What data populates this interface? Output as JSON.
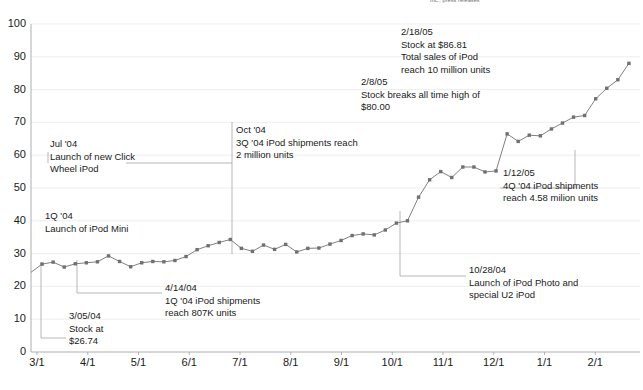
{
  "source_note": "Inc., press releases",
  "chart_data": {
    "type": "line",
    "title": "",
    "subtitle": "",
    "xlabel": "",
    "ylabel": "",
    "ylim": [
      0,
      100
    ],
    "yticks": [
      0,
      10,
      20,
      30,
      40,
      50,
      60,
      70,
      80,
      90,
      100
    ],
    "xticks": [
      "3/1",
      "4/1",
      "5/1",
      "6/1",
      "7/1",
      "8/1",
      "9/1",
      "10/1",
      "11/1",
      "12/1",
      "1/1",
      "2/1"
    ],
    "grid": true,
    "legend": "none",
    "series": [
      {
        "name": "Apple stock price",
        "color": "#808080",
        "marker": "square",
        "values": [
          24.3,
          26.8,
          27.4,
          25.9,
          26.9,
          27.2,
          27.5,
          29.3,
          27.6,
          26.0,
          27.2,
          27.6,
          27.5,
          27.9,
          29.1,
          31.2,
          32.4,
          33.4,
          34.3,
          31.6,
          30.7,
          32.6,
          31.3,
          32.8,
          30.5,
          31.6,
          31.7,
          32.9,
          34.0,
          35.5,
          36.0,
          35.7,
          37.2,
          39.3,
          40.0,
          47.2,
          52.5,
          55.0,
          53.2,
          56.4,
          56.4,
          54.9,
          55.2,
          66.5,
          64.2,
          66.1,
          65.9,
          68.0,
          69.8,
          71.6,
          72.1,
          77.2,
          80.4,
          83.0,
          88.0
        ]
      }
    ],
    "annotations": [
      {
        "id": "1q04-ipod-mini",
        "lines": [
          "1Q '04",
          "Launch of iPod Mini"
        ],
        "x": 45,
        "y": 210
      },
      {
        "id": "jul04-click-wheel",
        "lines": [
          "Jul '04",
          "Launch of new Click",
          "Wheel iPod"
        ],
        "x": 50,
        "y": 138
      },
      {
        "id": "oct04-3q-shipments",
        "lines": [
          "Oct '04",
          "3Q '04 iPod shipments reach",
          "2 million units"
        ],
        "x": 236,
        "y": 124
      },
      {
        "id": "feb08-05-all-time-high",
        "lines": [
          "2/8/05",
          "Stock breaks all time high of",
          "$80.00"
        ],
        "x": 361,
        "y": 76
      },
      {
        "id": "feb18-05-10-million",
        "lines": [
          "2/18/05",
          "Stock at $86.81",
          "Total sales of iPod",
          "reach 10 million units"
        ],
        "x": 401,
        "y": 26
      },
      {
        "id": "jan12-05-4q-shipments",
        "lines": [
          "1/12/05",
          "4Q '04  iPod shipments",
          "reach 4.58 milion units"
        ],
        "x": 503,
        "y": 167
      },
      {
        "id": "oct28-04-ipod-photo",
        "lines": [
          "10/28/04",
          "Launch of iPod Photo and",
          "special U2 iPod"
        ],
        "x": 469,
        "y": 264
      },
      {
        "id": "apr14-04-1q-shipments",
        "lines": [
          "4/14/04",
          "1Q '04 iPod shipments",
          "reach 807K units"
        ],
        "x": 165,
        "y": 282
      },
      {
        "id": "mar05-04-stock",
        "lines": [
          "3/05/04",
          "Stock at",
          "$26.74"
        ],
        "x": 69,
        "y": 310
      }
    ]
  }
}
